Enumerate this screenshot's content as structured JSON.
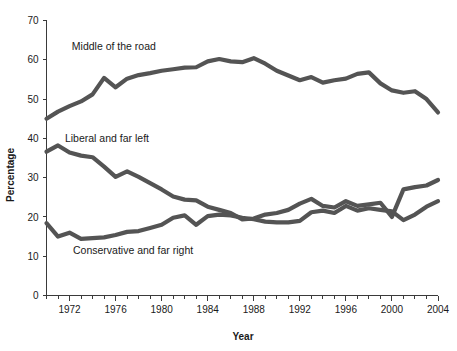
{
  "chart_data": {
    "type": "line",
    "title": "",
    "xlabel": "Year",
    "ylabel": "Percentage",
    "xlim": [
      1970,
      2004
    ],
    "ylim": [
      0,
      70
    ],
    "ytick_values": [
      0,
      10,
      20,
      30,
      40,
      50,
      60,
      70
    ],
    "ytick_labels": [
      "0",
      "10",
      "20",
      "30",
      "40",
      "50",
      "60",
      "70"
    ],
    "xtick_values": [
      1970,
      1971,
      1972,
      1973,
      1974,
      1975,
      1976,
      1977,
      1978,
      1979,
      1980,
      1981,
      1982,
      1983,
      1984,
      1985,
      1986,
      1987,
      1988,
      1989,
      1990,
      1991,
      1992,
      1993,
      1994,
      1995,
      1996,
      1997,
      1998,
      1999,
      2000,
      2001,
      2002,
      2003,
      2004
    ],
    "xtick_labels": [
      "1972",
      "1976",
      "1980",
      "1984",
      "1988",
      "1992",
      "1996",
      "2000",
      "2004"
    ],
    "xtick_label_values": [
      1972,
      1976,
      1980,
      1984,
      1988,
      1992,
      1996,
      2000,
      2004
    ],
    "grid": false,
    "legend_position": "inline-annotations",
    "line_color": "#545454",
    "x": [
      1970,
      1971,
      1972,
      1973,
      1974,
      1975,
      1976,
      1977,
      1978,
      1979,
      1980,
      1981,
      1982,
      1983,
      1984,
      1985,
      1986,
      1987,
      1988,
      1989,
      1990,
      1991,
      1992,
      1993,
      1994,
      1995,
      1996,
      1997,
      1998,
      1999,
      2000,
      2001,
      2002,
      2003,
      2004
    ],
    "series": [
      {
        "name": "Middle of the road",
        "label_x": 1972.2,
        "label_y": 62.5,
        "values": [
          45.0,
          46.8,
          48.2,
          49.4,
          51.2,
          55.4,
          53.0,
          55.2,
          56.1,
          56.6,
          57.2,
          57.6,
          58.0,
          58.1,
          59.6,
          60.2,
          59.6,
          59.4,
          60.4,
          59.0,
          57.2,
          56.0,
          54.8,
          55.6,
          54.2,
          54.8,
          55.2,
          56.4,
          56.8,
          54.0,
          52.2,
          51.6,
          52.0,
          50.0,
          46.6
        ]
      },
      {
        "name": "Liberal and far left",
        "label_x": 1971.6,
        "label_y": 39.0,
        "values": [
          36.6,
          38.2,
          36.4,
          35.6,
          35.2,
          32.8,
          30.2,
          31.6,
          30.2,
          28.6,
          27.0,
          25.2,
          24.4,
          24.2,
          22.6,
          21.8,
          21.0,
          19.4,
          19.6,
          20.6,
          21.0,
          21.8,
          23.4,
          24.6,
          22.8,
          22.4,
          24.0,
          22.8,
          23.2,
          23.6,
          20.0,
          27.0,
          27.6,
          28.0,
          29.4
        ]
      },
      {
        "name": "Conservative and far right",
        "label_x": 1972.3,
        "label_y": 10.6,
        "values": [
          18.4,
          15.0,
          16.0,
          14.4,
          14.6,
          14.8,
          15.4,
          16.2,
          16.4,
          17.2,
          18.0,
          19.8,
          20.4,
          18.0,
          20.2,
          20.6,
          20.4,
          19.8,
          19.4,
          18.8,
          18.6,
          18.6,
          19.0,
          21.2,
          21.6,
          21.0,
          22.8,
          21.6,
          22.2,
          21.8,
          21.4,
          19.2,
          20.6,
          22.6,
          24.0
        ]
      }
    ]
  }
}
